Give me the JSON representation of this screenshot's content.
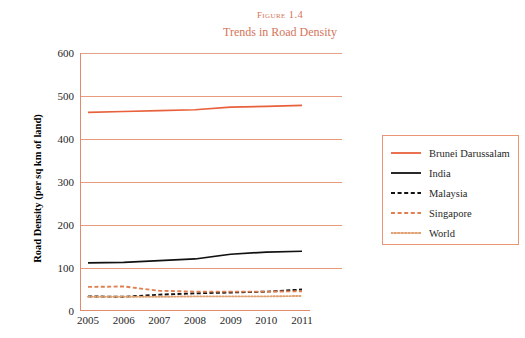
{
  "title": {
    "figure_number": "Figure 1.4",
    "subtitle": "Trends in Road Density",
    "color": "#d4745a"
  },
  "axes": {
    "ylabel": "Road Density (per sq km of land)",
    "xlabel": "",
    "ytick_labels": [
      "600",
      "500",
      "400",
      "300",
      "200",
      "100",
      "0"
    ],
    "xtick_labels": [
      "2005",
      "2006",
      "2007",
      "2008",
      "2009",
      "2010",
      "2011"
    ]
  },
  "legend": {
    "items": [
      {
        "label": "Brunei Darussalam",
        "style": "solid",
        "color": "#e8613c"
      },
      {
        "label": "India",
        "style": "solid",
        "color": "#111111"
      },
      {
        "label": "Malaysia",
        "style": "dashed",
        "color": "#111111"
      },
      {
        "label": "Singapore",
        "style": "dashed",
        "color": "#e08050"
      },
      {
        "label": "World",
        "style": "dotted",
        "color": "#e0a070"
      }
    ]
  },
  "chart_data": {
    "type": "line",
    "title": "Trends in Road Density",
    "xlabel": "",
    "ylabel": "Road Density (per sq km of land)",
    "categories": [
      "2005",
      "2006",
      "2007",
      "2008",
      "2009",
      "2010",
      "2011"
    ],
    "ylim": [
      0,
      600
    ],
    "ytick_step": 100,
    "grid": true,
    "legend_position": "right",
    "series": [
      {
        "name": "Brunei Darussalam",
        "color": "#e8613c",
        "style": "solid",
        "values": [
          462,
          464,
          466,
          468,
          474,
          476,
          478
        ]
      },
      {
        "name": "India",
        "color": "#111111",
        "style": "solid",
        "values": [
          112,
          113,
          117,
          121,
          132,
          137,
          139
        ]
      },
      {
        "name": "Malaysia",
        "color": "#111111",
        "style": "dashed",
        "values": [
          34,
          33,
          38,
          41,
          43,
          45,
          50
        ]
      },
      {
        "name": "Singapore",
        "color": "#e08050",
        "style": "dashed",
        "values": [
          56,
          57,
          47,
          45,
          45,
          45,
          46
        ]
      },
      {
        "name": "World",
        "color": "#e0a070",
        "style": "dotted",
        "values": [
          33,
          33,
          33,
          34,
          34,
          34,
          35
        ]
      }
    ]
  }
}
